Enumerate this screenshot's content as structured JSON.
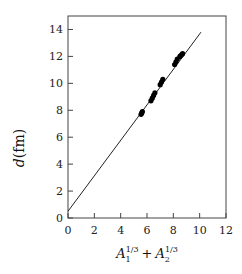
{
  "chart_data": {
    "type": "scatter",
    "title": "",
    "xlabel": "A_1^{1/3} + A_2^{1/3}",
    "ylabel": "d(fm)",
    "xlim": [
      0,
      12
    ],
    "ylim": [
      0,
      15
    ],
    "xticks": [
      0,
      2,
      4,
      6,
      8,
      10,
      12
    ],
    "yticks": [
      0,
      2,
      4,
      6,
      8,
      10,
      12,
      14
    ],
    "grid": false,
    "series": [
      {
        "name": "data",
        "type": "scatter",
        "x": [
          5.55,
          5.6,
          5.65,
          6.3,
          6.4,
          6.5,
          6.6,
          7.0,
          7.1,
          7.2,
          8.1,
          8.2,
          8.3,
          8.5,
          8.6,
          8.7
        ],
        "y": [
          7.7,
          7.8,
          7.9,
          8.7,
          8.9,
          9.1,
          9.3,
          9.9,
          10.1,
          10.3,
          11.4,
          11.6,
          11.8,
          12.0,
          12.1,
          12.2
        ]
      },
      {
        "name": "fit",
        "type": "line",
        "x": [
          0,
          10.1
        ],
        "y": [
          0.5,
          13.8
        ]
      }
    ]
  },
  "labels": {
    "xlabel_base1": "A",
    "xlabel_sub1": "1",
    "xlabel_sup1": "1/3",
    "xlabel_plus": "+",
    "xlabel_base2": "A",
    "xlabel_sub2": "2",
    "xlabel_sup2": "1/3",
    "ylabel_d": "d",
    "ylabel_unit": "(fm)"
  }
}
